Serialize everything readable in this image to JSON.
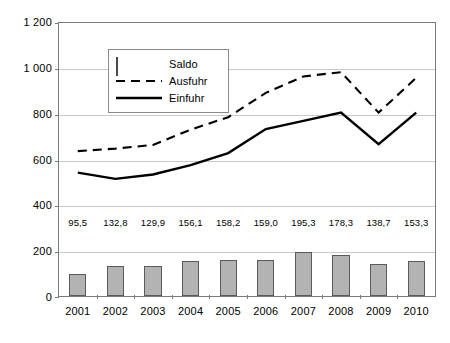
{
  "chart_data": {
    "type": "bar",
    "title": "",
    "subtitle": "",
    "xlabel": "",
    "ylabel": "",
    "categories": [
      "2001",
      "2002",
      "2003",
      "2004",
      "2005",
      "2006",
      "2007",
      "2008",
      "2009",
      "2010"
    ],
    "ylim": [
      0,
      1200
    ],
    "yticks": [
      0,
      200,
      400,
      600,
      800,
      1000,
      1200
    ],
    "ytick_labels": [
      "0",
      "200",
      "400",
      "600",
      "800",
      "1 000",
      "1 200"
    ],
    "grid": true,
    "legend_position": "top-left-inside",
    "series": [
      {
        "name": "Saldo",
        "type": "bar",
        "values": [
          95.5,
          132.8,
          129.9,
          156.1,
          158.2,
          159.0,
          195.3,
          178.3,
          138.7,
          153.3
        ],
        "data_labels": [
          "95,5",
          "132,8",
          "129,9",
          "156,1",
          "158,2",
          "159,0",
          "195,3",
          "178,3",
          "138,7",
          "153,3"
        ],
        "fill_color": "#b3b3b3",
        "border_color": "#5a5a5a"
      },
      {
        "name": "Ausfuhr",
        "type": "line",
        "line_style": "dashed",
        "values": [
          637,
          648,
          664,
          731,
          786,
          893,
          965,
          984,
          806,
          959
        ],
        "color": "#000000"
      },
      {
        "name": "Einfuhr",
        "type": "line",
        "line_style": "solid",
        "values": [
          542,
          515,
          534,
          575,
          628,
          734,
          770,
          806,
          667,
          806
        ],
        "color": "#000000"
      }
    ]
  },
  "legend": {
    "items": [
      {
        "label": "Saldo",
        "marker": "bar-swatch"
      },
      {
        "label": "Ausfuhr",
        "marker": "dashed-line"
      },
      {
        "label": "Einfuhr",
        "marker": "solid-line"
      }
    ]
  }
}
